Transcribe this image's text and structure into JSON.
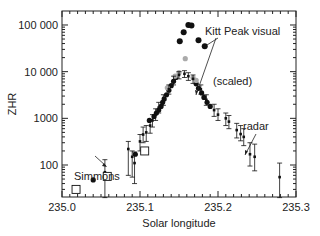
{
  "chart_data": {
    "type": "scatter",
    "title": "",
    "xlabel": "Solar longitude",
    "ylabel": "ZHR",
    "xlim": [
      235.0,
      235.3
    ],
    "ylim": [
      20,
      200000
    ],
    "yscale": "log",
    "grid": false,
    "x_ticks": [
      235.0,
      235.1,
      235.2,
      235.3
    ],
    "x_tick_labels": [
      "235.0",
      "235.1",
      "235.2",
      "235.3"
    ],
    "y_ticks": [
      100,
      1000,
      10000,
      100000
    ],
    "y_tick_labels": [
      "100",
      "1000",
      "10 000",
      "100 000"
    ],
    "annotations": [
      {
        "text": "Kitt Peak visual",
        "x": 235.24,
        "y": 30000
      },
      {
        "text": "(scaled)",
        "x": 235.19,
        "y": 3500
      },
      {
        "text": "radar",
        "x": 235.26,
        "y": 800
      },
      {
        "text": "Simmons",
        "x": 235.03,
        "y": 150
      }
    ],
    "series": [
      {
        "name": "Kitt Peak visual",
        "marker": "filled-circle-large",
        "color": "#111111",
        "points": [
          [
            235.151,
            45000
          ],
          [
            235.162,
            100000
          ],
          [
            235.166,
            97000
          ],
          [
            235.156,
            70000
          ],
          [
            235.175,
            47000
          ],
          [
            235.183,
            35000
          ]
        ]
      },
      {
        "name": "Kitt Peak visual (scaled)",
        "marker": "filled-circle",
        "color": "#111111",
        "points": [
          [
            235.04,
            48
          ],
          [
            235.094,
            170
          ],
          [
            235.112,
            900
          ],
          [
            235.118,
            1100
          ],
          [
            235.121,
            1300
          ],
          [
            235.124,
            1500
          ],
          [
            235.127,
            1800
          ],
          [
            235.129,
            2200
          ],
          [
            235.131,
            2600
          ],
          [
            235.134,
            3200
          ],
          [
            235.137,
            4000
          ],
          [
            235.14,
            5000
          ],
          [
            235.143,
            6200
          ],
          [
            235.146,
            7500
          ],
          [
            235.172,
            5500
          ],
          [
            235.175,
            4400
          ],
          [
            235.179,
            3500
          ],
          [
            235.182,
            2800
          ],
          [
            235.186,
            2200
          ],
          [
            235.19,
            1800
          ]
        ]
      },
      {
        "name": "Grey points",
        "marker": "filled-circle",
        "color": "#aaaaaa",
        "points": [
          [
            235.158,
            19000
          ],
          [
            235.15,
            9500
          ],
          [
            235.145,
            8000
          ],
          [
            235.172,
            6500
          ],
          [
            235.168,
            7500
          ],
          [
            235.135,
            4500
          ]
        ]
      },
      {
        "name": "radar",
        "marker": "small-square-errorbar",
        "color": "#111111",
        "points": [
          [
            235.055,
            70,
            20,
            130
          ],
          [
            235.085,
            220,
            60,
            320
          ],
          [
            235.09,
            150,
            55,
            200
          ],
          [
            235.093,
            110,
            40,
            190
          ],
          [
            235.1,
            320,
            200,
            450
          ],
          [
            235.104,
            450,
            300,
            650
          ],
          [
            235.108,
            500,
            320,
            700
          ],
          [
            235.113,
            700,
            480,
            950
          ],
          [
            235.116,
            900,
            650,
            1200
          ],
          [
            235.12,
            1200,
            900,
            1600
          ],
          [
            235.124,
            1700,
            1300,
            2200
          ],
          [
            235.13,
            2500,
            1900,
            3200
          ],
          [
            235.137,
            4200,
            3300,
            5200
          ],
          [
            235.143,
            6500,
            5200,
            8000
          ],
          [
            235.15,
            8500,
            7000,
            10000
          ],
          [
            235.157,
            9000,
            7500,
            10500
          ],
          [
            235.162,
            8000,
            6500,
            9500
          ],
          [
            235.168,
            7000,
            5600,
            8500
          ],
          [
            235.178,
            4200,
            3300,
            5200
          ],
          [
            235.185,
            2500,
            1900,
            3200
          ],
          [
            235.195,
            1500,
            1100,
            2000
          ],
          [
            235.2,
            1200,
            900,
            1600
          ],
          [
            235.21,
            1000,
            700,
            1300
          ],
          [
            235.214,
            850,
            600,
            1150
          ],
          [
            235.224,
            560,
            380,
            780
          ],
          [
            235.229,
            460,
            330,
            700
          ],
          [
            235.233,
            400,
            260,
            600
          ],
          [
            235.241,
            170,
            95,
            300
          ],
          [
            235.247,
            150,
            75,
            280
          ],
          [
            235.279,
            55,
            20,
            110
          ]
        ]
      },
      {
        "name": "Simmons",
        "marker": "open-square",
        "color": "#111111",
        "points": [
          [
            235.018,
            30
          ],
          [
            235.058,
            57
          ],
          [
            235.106,
            200
          ]
        ]
      }
    ]
  }
}
